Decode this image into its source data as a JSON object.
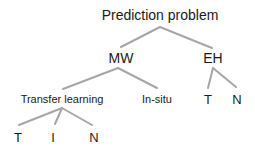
{
  "diagram": {
    "type": "tree",
    "edge_color": "#a6a6a6",
    "root": {
      "label": "Prediction problem",
      "children": [
        {
          "label": "MW",
          "children": [
            {
              "label": "Transfer learning",
              "children": [
                {
                  "label": "T"
                },
                {
                  "label": "I"
                },
                {
                  "label": "N"
                }
              ]
            },
            {
              "label": "In-situ"
            }
          ]
        },
        {
          "label": "EH",
          "children": [
            {
              "label": "T"
            },
            {
              "label": "N"
            }
          ]
        }
      ]
    }
  }
}
